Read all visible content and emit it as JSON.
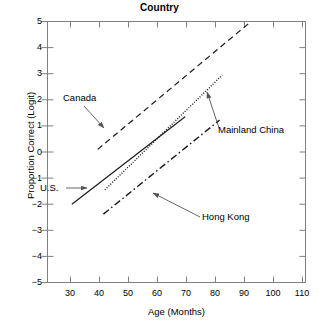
{
  "chart_data": {
    "type": "line",
    "title": "Country",
    "xlabel": "Age (Months)",
    "ylabel": "Proportion Correct (Logit)",
    "xlim": [
      20,
      110
    ],
    "ylim": [
      -5,
      5
    ],
    "xticks": [
      30,
      40,
      50,
      60,
      70,
      80,
      90,
      100,
      110
    ],
    "yticks": [
      5,
      4,
      3,
      2,
      1,
      0,
      -1,
      -2,
      -3,
      -4,
      -5
    ],
    "grid": false,
    "legend": "annotations-with-arrows",
    "series": [
      {
        "name": "Canada",
        "style": "dashed",
        "x": [
          37.5,
          91.0
        ],
        "y": [
          0.1,
          5.0
        ]
      },
      {
        "name": "Mainland China",
        "style": "dotted",
        "x": [
          40.0,
          81.0
        ],
        "y": [
          -1.45,
          2.95
        ]
      },
      {
        "name": "U.S.",
        "style": "solid",
        "x": [
          28.5,
          68.0
        ],
        "y": [
          -2.0,
          1.35
        ]
      },
      {
        "name": "Hong Kong",
        "style": "dash-dot",
        "x": [
          39.5,
          80.0
        ],
        "y": [
          -2.38,
          1.22
        ]
      }
    ],
    "annotations": [
      {
        "label": "Canada",
        "target_series": "Canada"
      },
      {
        "label": "Mainland China",
        "target_series": "Mainland China"
      },
      {
        "label": "U.S.",
        "target_series": "U.S."
      },
      {
        "label": "Hong Kong",
        "target_series": "Hong Kong"
      }
    ],
    "colors": {
      "line": "#000000",
      "axis": "#808080",
      "text": "#000000",
      "background": "#ffffff"
    }
  },
  "ticks": {
    "x": [
      "30",
      "40",
      "50",
      "60",
      "70",
      "80",
      "90",
      "100",
      "110"
    ],
    "y": [
      "5",
      "4",
      "3",
      "2",
      "1",
      "0",
      "−1",
      "−2",
      "−3",
      "−4",
      "−5"
    ]
  },
  "labels": {
    "canada": "Canada",
    "mainland_china": "Mainland China",
    "us": "U.S.",
    "hong_kong": "Hong Kong"
  }
}
